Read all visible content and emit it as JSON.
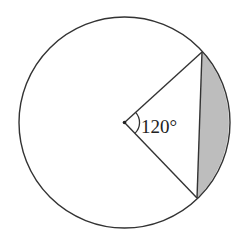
{
  "diagram": {
    "type": "circle-segment",
    "colors": {
      "stroke": "#333333",
      "shaded_segment": "#bdbdbd",
      "background": "#ffffff"
    },
    "circle": {
      "cx": 124.5,
      "cy": 122.5,
      "r": 105.5
    },
    "center_point": {
      "x": 124.5,
      "y": 122.5
    },
    "chord": {
      "p1": {
        "x": 202,
        "y": 52
      },
      "p2": {
        "x": 197,
        "y": 198
      }
    },
    "central_angle": {
      "label": "120°",
      "degrees": 120
    }
  }
}
